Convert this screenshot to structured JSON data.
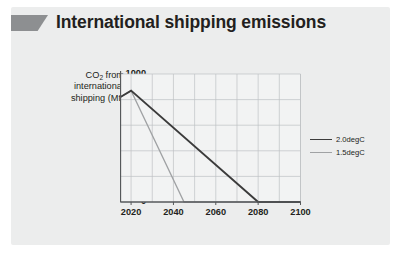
{
  "title": {
    "text": "International shipping emissions",
    "icon": "parallelogram-flag-icon",
    "icon_color": "#8d8f91"
  },
  "panel": {
    "background": "#eceded"
  },
  "chart_data": {
    "type": "line",
    "title": "International shipping emissions",
    "xlabel": "",
    "ylabel": "CO2 from international shipping (Mt)",
    "ylabel_lines": [
      "CO",
      "2",
      " from",
      "international",
      "shipping (Mt)"
    ],
    "xlim": [
      2015,
      2100
    ],
    "ylim": [
      0,
      1000
    ],
    "xticks": [
      2020,
      2040,
      2060,
      2080,
      2100
    ],
    "yticks": [
      0,
      200,
      400,
      600,
      800,
      1000
    ],
    "xtick_labels": [
      "2020",
      "2040",
      "2060",
      "2080",
      "2100"
    ],
    "ytick_labels": [
      "0",
      "200",
      "400",
      "600",
      "800",
      "1000"
    ],
    "grid": true,
    "grid_x_minor_step": 10,
    "legend_position": "right",
    "series": [
      {
        "name": "2.0degC",
        "color": "#3b3b3b",
        "width": 1.9,
        "points": [
          [
            2015,
            820
          ],
          [
            2020,
            870
          ],
          [
            2080,
            0
          ],
          [
            2100,
            0
          ]
        ]
      },
      {
        "name": "1.5degC",
        "color": "#a0a2a4",
        "width": 1.3,
        "points": [
          [
            2015,
            820
          ],
          [
            2020,
            870
          ],
          [
            2045,
            0
          ],
          [
            2100,
            0
          ]
        ]
      }
    ]
  },
  "legend": {
    "items": [
      {
        "label": "2.0degC",
        "color": "#3b3b3b",
        "width": "1.9px"
      },
      {
        "label": "1.5degC",
        "color": "#a0a2a4",
        "width": "1.3px"
      }
    ]
  },
  "axes_style": {
    "axis_color": "#56595b",
    "grid_color": "#bfc2c4",
    "plot_background": "#f2f3f3"
  }
}
